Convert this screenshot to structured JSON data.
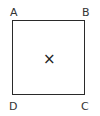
{
  "diagram": {
    "shape": "square",
    "vertices": {
      "top_left": "A",
      "top_right": "B",
      "bottom_right": "C",
      "bottom_left": "D"
    },
    "center_mark": "×",
    "colors": {
      "stroke": "#2a2a2a",
      "background": "#ffffff"
    }
  }
}
